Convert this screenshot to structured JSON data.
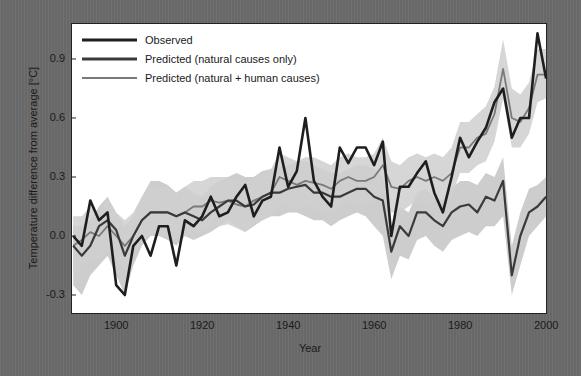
{
  "chart_data": {
    "type": "line",
    "title": "",
    "xlabel": "Year",
    "ylabel": "Temperature difference from average [°C]",
    "xlim": [
      1889.5,
      2000.5
    ],
    "ylim": [
      -0.4,
      1.1
    ],
    "x_ticks": [
      1900,
      1920,
      1940,
      1960,
      1980,
      2000
    ],
    "x_tick_labels": [
      "1900",
      "1920",
      "1940",
      "1960",
      "1980",
      "2000"
    ],
    "y_ticks": [
      -0.3,
      0.0,
      0.3,
      0.6,
      0.9
    ],
    "y_tick_labels": [
      "-0.3",
      "0.0",
      "0.3",
      "0.6",
      "0.9"
    ],
    "grid": false,
    "legend_position": "upper left",
    "legend": [
      "Observed",
      "Predicted (natural causes only)",
      "Predicted (natural + human causes)"
    ],
    "x": [
      1890,
      1892,
      1894,
      1896,
      1898,
      1900,
      1902,
      1904,
      1906,
      1908,
      1910,
      1912,
      1914,
      1916,
      1918,
      1920,
      1922,
      1924,
      1926,
      1928,
      1930,
      1932,
      1934,
      1936,
      1938,
      1940,
      1942,
      1944,
      1946,
      1948,
      1950,
      1952,
      1954,
      1956,
      1958,
      1960,
      1962,
      1964,
      1966,
      1968,
      1970,
      1972,
      1974,
      1976,
      1978,
      1980,
      1982,
      1984,
      1986,
      1988,
      1990,
      1992,
      1994,
      1996,
      1998,
      2000
    ],
    "series": [
      {
        "name": "Observed",
        "color": "#1e1e1e",
        "width": 2.6,
        "values": [
          0.0,
          -0.05,
          0.18,
          0.08,
          0.12,
          -0.25,
          -0.3,
          -0.05,
          0.0,
          -0.1,
          0.05,
          0.05,
          -0.15,
          0.08,
          0.05,
          0.1,
          0.2,
          0.1,
          0.12,
          0.2,
          0.26,
          0.1,
          0.18,
          0.2,
          0.45,
          0.25,
          0.33,
          0.6,
          0.28,
          0.2,
          0.15,
          0.45,
          0.37,
          0.45,
          0.45,
          0.36,
          0.48,
          0.0,
          0.25,
          0.25,
          0.32,
          0.38,
          0.22,
          0.12,
          0.3,
          0.5,
          0.4,
          0.48,
          0.55,
          0.68,
          0.75,
          0.5,
          0.6,
          0.6,
          1.03,
          0.8
        ]
      },
      {
        "name": "Predicted (natural causes only)",
        "color": "#3a3a3a",
        "width": 2.2,
        "values": [
          -0.05,
          -0.1,
          -0.05,
          0.05,
          0.08,
          0.03,
          -0.1,
          0.0,
          0.08,
          0.12,
          0.12,
          0.12,
          0.1,
          0.12,
          0.1,
          0.08,
          0.12,
          0.15,
          0.18,
          0.18,
          0.15,
          0.16,
          0.2,
          0.22,
          0.22,
          0.24,
          0.25,
          0.26,
          0.22,
          0.22,
          0.2,
          0.2,
          0.22,
          0.24,
          0.24,
          0.2,
          0.18,
          -0.08,
          0.05,
          0.0,
          0.12,
          0.12,
          0.08,
          0.05,
          0.12,
          0.15,
          0.16,
          0.12,
          0.2,
          0.18,
          0.28,
          -0.2,
          0.0,
          0.12,
          0.15,
          0.2
        ]
      },
      {
        "name": "Predicted (natural + human causes)",
        "color": "#7a7a7a",
        "width": 1.8,
        "values": [
          -0.05,
          -0.02,
          0.02,
          0.0,
          0.05,
          0.0,
          -0.05,
          0.0,
          0.08,
          0.12,
          0.12,
          0.12,
          0.1,
          0.12,
          0.15,
          0.15,
          0.18,
          0.17,
          0.18,
          0.16,
          0.15,
          0.18,
          0.2,
          0.22,
          0.3,
          0.28,
          0.26,
          0.28,
          0.27,
          0.26,
          0.24,
          0.28,
          0.3,
          0.28,
          0.28,
          0.3,
          0.36,
          0.25,
          0.24,
          0.28,
          0.3,
          0.28,
          0.3,
          0.28,
          0.32,
          0.45,
          0.45,
          0.5,
          0.52,
          0.62,
          0.85,
          0.6,
          0.58,
          0.65,
          0.82,
          0.82
        ]
      }
    ],
    "bands": [
      {
        "name": "Natural causes only range",
        "color": "#c4c4c4",
        "lower": [
          -0.25,
          -0.3,
          -0.2,
          -0.15,
          -0.1,
          -0.2,
          -0.3,
          -0.15,
          -0.05,
          0.0,
          0.0,
          -0.02,
          -0.05,
          0.0,
          -0.02,
          0.0,
          0.02,
          0.05,
          0.08,
          0.05,
          0.02,
          0.05,
          0.08,
          0.1,
          0.1,
          0.12,
          0.12,
          0.1,
          0.08,
          0.08,
          0.05,
          0.08,
          0.1,
          0.12,
          0.1,
          0.05,
          0.0,
          -0.22,
          -0.1,
          -0.12,
          -0.02,
          0.0,
          -0.05,
          -0.08,
          -0.02,
          0.0,
          0.02,
          0.0,
          0.05,
          0.05,
          0.1,
          -0.3,
          -0.15,
          0.0,
          0.05,
          0.1
        ],
        "upper": [
          0.05,
          0.05,
          0.08,
          0.15,
          0.2,
          0.12,
          0.05,
          0.1,
          0.2,
          0.28,
          0.28,
          0.26,
          0.22,
          0.25,
          0.22,
          0.2,
          0.25,
          0.28,
          0.3,
          0.32,
          0.3,
          0.3,
          0.33,
          0.34,
          0.35,
          0.36,
          0.38,
          0.38,
          0.36,
          0.34,
          0.32,
          0.32,
          0.34,
          0.36,
          0.36,
          0.34,
          0.3,
          0.05,
          0.15,
          0.12,
          0.22,
          0.24,
          0.2,
          0.18,
          0.24,
          0.28,
          0.28,
          0.26,
          0.32,
          0.3,
          0.4,
          -0.05,
          0.12,
          0.24,
          0.26,
          0.3
        ]
      },
      {
        "name": "Natural + human causes range",
        "color": "#cfcfcf",
        "lower": [
          -0.2,
          -0.15,
          -0.12,
          -0.12,
          -0.08,
          -0.12,
          -0.18,
          -0.1,
          -0.02,
          0.0,
          0.0,
          0.0,
          -0.02,
          0.0,
          0.02,
          0.02,
          0.05,
          0.05,
          0.06,
          0.04,
          0.02,
          0.06,
          0.08,
          0.1,
          0.16,
          0.15,
          0.14,
          0.15,
          0.14,
          0.12,
          0.1,
          0.15,
          0.18,
          0.16,
          0.16,
          0.18,
          0.22,
          0.12,
          0.12,
          0.15,
          0.18,
          0.16,
          0.18,
          0.16,
          0.2,
          0.32,
          0.32,
          0.36,
          0.38,
          0.48,
          0.7,
          0.45,
          0.45,
          0.52,
          0.68,
          0.7
        ],
        "upper": [
          0.1,
          0.1,
          0.15,
          0.12,
          0.18,
          0.12,
          0.08,
          0.12,
          0.2,
          0.25,
          0.25,
          0.25,
          0.22,
          0.25,
          0.28,
          0.28,
          0.3,
          0.3,
          0.3,
          0.28,
          0.28,
          0.3,
          0.32,
          0.34,
          0.42,
          0.4,
          0.38,
          0.4,
          0.4,
          0.38,
          0.36,
          0.4,
          0.42,
          0.4,
          0.4,
          0.42,
          0.5,
          0.38,
          0.36,
          0.4,
          0.42,
          0.4,
          0.42,
          0.4,
          0.45,
          0.58,
          0.58,
          0.62,
          0.66,
          0.76,
          1.0,
          0.75,
          0.72,
          0.78,
          0.95,
          0.95
        ]
      }
    ]
  }
}
